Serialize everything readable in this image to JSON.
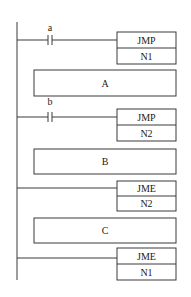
{
  "diagram": {
    "type": "ladder-logic",
    "rungs": [
      {
        "contact": "a",
        "instruction": "JMP",
        "operand": "N1"
      },
      {
        "block": "A"
      },
      {
        "contact": "b",
        "instruction": "JMP",
        "operand": "N2"
      },
      {
        "block": "B"
      },
      {
        "contact": null,
        "instruction": "JME",
        "operand": "N2"
      },
      {
        "block": "C"
      },
      {
        "contact": null,
        "instruction": "JME",
        "operand": "N1"
      }
    ]
  },
  "labels": {
    "contact_a": "a",
    "contact_b": "b",
    "jmp1": "JMP",
    "jmp1_op": "N1",
    "block_a": "A",
    "jmp2": "JMP",
    "jmp2_op": "N2",
    "block_b": "B",
    "jme1": "JME",
    "jme1_op": "N2",
    "block_c": "C",
    "jme2": "JME",
    "jme2_op": "N1"
  }
}
